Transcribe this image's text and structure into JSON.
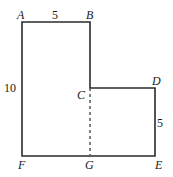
{
  "figure": {
    "background_color": "#ffffff",
    "stroke_color": "#2b2b2b",
    "stroke_width": 1.6,
    "dashed_stroke_color": "#555555",
    "vertices": {
      "A": {
        "label": "A",
        "x": 22,
        "y": 22
      },
      "B": {
        "label": "B",
        "x": 90,
        "y": 22
      },
      "C": {
        "label": "C",
        "x": 90,
        "y": 88
      },
      "D": {
        "label": "D",
        "x": 155,
        "y": 88
      },
      "E": {
        "label": "E",
        "x": 155,
        "y": 156
      },
      "F": {
        "label": "F",
        "x": 22,
        "y": 156
      },
      "G": {
        "label": "G",
        "x": 90,
        "y": 156
      }
    },
    "dimensions": {
      "top_AB": "5",
      "left_AF": "10",
      "right_DE": "5"
    },
    "outline_path": "M 22 22 L 90 22 L 90 88 L 155 88 L 155 156 L 22 156 Z",
    "dashed_segment": {
      "from": "C",
      "to": "G",
      "x": 90,
      "y1": 88,
      "y2": 156
    }
  }
}
